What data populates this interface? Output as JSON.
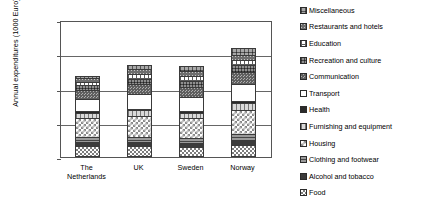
{
  "chart_data": {
    "type": "bar",
    "stacked": true,
    "title": "",
    "xlabel": "",
    "ylabel": "Annual expenditures (1000 Euro)",
    "ylim": [
      0,
      40
    ],
    "yticks": [
      "0",
      "10",
      "20",
      "30",
      "40"
    ],
    "grid": true,
    "legend_position": "right",
    "categories": [
      "The Netherlands",
      "UK",
      "Sweden",
      "Norway"
    ],
    "category_lines": [
      [
        "The",
        "Netherlands"
      ],
      [
        "UK"
      ],
      [
        "Sweden"
      ],
      [
        "Norway"
      ]
    ],
    "totals": [
      23.8,
      26.9,
      26.7,
      31.8
    ],
    "series": [
      {
        "name": "Food",
        "pattern": "p-food",
        "values": [
          3.2,
          3.1,
          3.0,
          3.6
        ]
      },
      {
        "name": "Alcohol and tobacco",
        "pattern": "p-alcohol",
        "values": [
          1.1,
          1.2,
          1.2,
          1.3
        ]
      },
      {
        "name": "Clothing and footwear",
        "pattern": "p-clothing",
        "values": [
          1.5,
          1.6,
          1.5,
          1.9
        ]
      },
      {
        "name": "Housing",
        "pattern": "p-housing",
        "values": [
          5.5,
          6.0,
          5.6,
          7.0
        ]
      },
      {
        "name": "Furnishing and equipment",
        "pattern": "p-furnishing",
        "values": [
          1.6,
          1.7,
          1.6,
          2.0
        ]
      },
      {
        "name": "Health",
        "pattern": "p-health",
        "values": [
          0.5,
          0.5,
          0.5,
          0.6
        ]
      },
      {
        "name": "Transport",
        "pattern": "p-transport",
        "values": [
          3.6,
          4.2,
          4.0,
          5.0
        ]
      },
      {
        "name": "Communication",
        "pattern": "p-communication",
        "values": [
          2.6,
          2.9,
          3.0,
          3.3
        ]
      },
      {
        "name": "Recreation and culture",
        "pattern": "p-recreation",
        "values": [
          1.5,
          1.7,
          1.8,
          2.1
        ]
      },
      {
        "name": "Education",
        "pattern": "p-education",
        "values": [
          0.9,
          1.4,
          1.4,
          1.4
        ]
      },
      {
        "name": "Restaurants and hotels",
        "pattern": "p-restaurants",
        "values": [
          1.1,
          1.3,
          1.4,
          1.6
        ]
      },
      {
        "name": "Miscellaneous",
        "pattern": "p-misc",
        "values": [
          0.7,
          1.3,
          1.7,
          2.0
        ]
      }
    ]
  }
}
